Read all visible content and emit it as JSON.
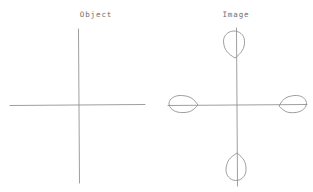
{
  "figure": {
    "background_color": "#ffffff",
    "ink_color": "#8c8c8c",
    "label_color": "#6d6d6d",
    "caption_object": "Object",
    "caption_image": "Image"
  },
  "panels": [
    {
      "id": "object",
      "label": "Object",
      "label_x": 96,
      "label_y": 17,
      "origin_x": 78.5,
      "origin_y": 105,
      "x_axis": {
        "x1": 10,
        "y1": 105.5,
        "x2": 145,
        "y2": 104.5
      },
      "y_axis": {
        "x1": 78.5,
        "y1": 29,
        "x2": 79.5,
        "y2": 183
      },
      "lobes": []
    },
    {
      "id": "image",
      "label": "Image",
      "label_x": 236,
      "label_y": 17,
      "origin_x": 237,
      "origin_y": 105,
      "x_axis": {
        "x1": 168,
        "y1": 105.5,
        "x2": 307,
        "y2": 104.5
      },
      "y_axis": {
        "x1": 236.5,
        "y1": 28,
        "x2": 237.5,
        "y2": 186
      },
      "lobes": [
        {
          "name": "lobe-top",
          "direction": "up",
          "tip_x": 235,
          "tip_y": 58,
          "bulb_center_x": 234,
          "bulb_center_y": 41,
          "bulb_rx": 10.5,
          "bulb_ry": 10.0
        },
        {
          "name": "lobe-right",
          "direction": "right",
          "tip_x": 279,
          "tip_y": 106,
          "bulb_center_x": 295,
          "bulb_center_y": 104,
          "bulb_rx": 11.5,
          "bulb_ry": 8.5
        },
        {
          "name": "lobe-bottom",
          "direction": "down",
          "tip_x": 237,
          "tip_y": 153,
          "bulb_center_x": 236,
          "bulb_center_y": 170,
          "bulb_rx": 10.0,
          "bulb_ry": 10.5
        },
        {
          "name": "lobe-left",
          "direction": "left",
          "tip_x": 198,
          "tip_y": 105,
          "bulb_center_x": 181,
          "bulb_center_y": 104,
          "bulb_rx": 12.0,
          "bulb_ry": 8.5
        }
      ]
    }
  ],
  "chart_data": {
    "type": "line",
    "subtitle": "",
    "xlabel": "",
    "ylabel": "",
    "grid": false,
    "legend": "none",
    "panels": [
      {
        "name": "Object",
        "description": "Plain pair of orthogonal coordinate axes with no lobes.",
        "lobe_count": 0,
        "lobe_directions": []
      },
      {
        "name": "Image",
        "description": "Same orthogonal coordinate axes with four teardrop lobes, one on each half-axis, each lobe's point directed toward the origin.",
        "lobe_count": 4,
        "lobe_directions": [
          "up",
          "right",
          "down",
          "left"
        ]
      }
    ]
  }
}
